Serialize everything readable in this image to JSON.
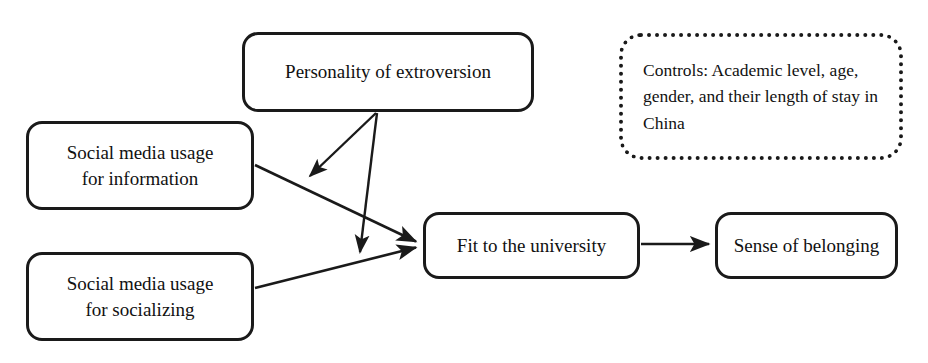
{
  "diagram": {
    "nodes": [
      {
        "id": "personality",
        "label": "Personality of extroversion",
        "x": 242,
        "y": 32,
        "w": 292,
        "h": 80,
        "shape": "rounded-rectangle",
        "border": "solid"
      },
      {
        "id": "social-media-information",
        "label": "Social media usage\nfor information",
        "x": 26,
        "y": 121,
        "w": 228,
        "h": 89,
        "shape": "rounded-rectangle",
        "border": "solid"
      },
      {
        "id": "social-media-socializing",
        "label": "Social media usage\nfor socializing",
        "x": 26,
        "y": 252,
        "w": 228,
        "h": 89,
        "shape": "rounded-rectangle",
        "border": "solid"
      },
      {
        "id": "fit-to-university",
        "label": "Fit to the university",
        "x": 423,
        "y": 212,
        "w": 217,
        "h": 67,
        "shape": "rounded-rectangle",
        "border": "solid"
      },
      {
        "id": "sense-of-belonging",
        "label": "Sense of belonging",
        "x": 715,
        "y": 212,
        "w": 183,
        "h": 67,
        "shape": "rounded-rectangle",
        "border": "solid"
      }
    ],
    "note": {
      "id": "controls-note",
      "label": "Controls: Academic level, age, gender, and their length of stay in China",
      "x": 619,
      "y": 33,
      "w": 284,
      "h": 127,
      "shape": "rounded-rectangle",
      "border": "dotted"
    },
    "edges": [
      {
        "id": "information-to-fit",
        "from": "social-media-information",
        "to": "fit-to-university",
        "type": "direct-effect",
        "x1": 255,
        "y1": 165,
        "x2": 419,
        "y2": 242
      },
      {
        "id": "socializing-to-fit",
        "from": "social-media-socializing",
        "to": "fit-to-university",
        "type": "direct-effect",
        "x1": 255,
        "y1": 288,
        "x2": 419,
        "y2": 248
      },
      {
        "id": "fit-to-belonging",
        "from": "fit-to-university",
        "to": "sense-of-belonging",
        "type": "direct-effect",
        "x1": 641,
        "y1": 244,
        "x2": 711,
        "y2": 244
      },
      {
        "id": "personality-moderates-information-path",
        "from": "personality",
        "to": "information-to-fit",
        "type": "moderation",
        "x1": 376,
        "y1": 113,
        "x2": 309,
        "y2": 177
      },
      {
        "id": "personality-moderates-socializing-path",
        "from": "personality",
        "to": "socializing-to-fit",
        "type": "moderation",
        "x1": 377,
        "y1": 113,
        "x2": 360,
        "y2": 254
      }
    ],
    "style": {
      "line_color": "#1a1a1a",
      "box_border_color": "#1a1a1a",
      "background": "#ffffff",
      "text_color": "#111111"
    }
  }
}
